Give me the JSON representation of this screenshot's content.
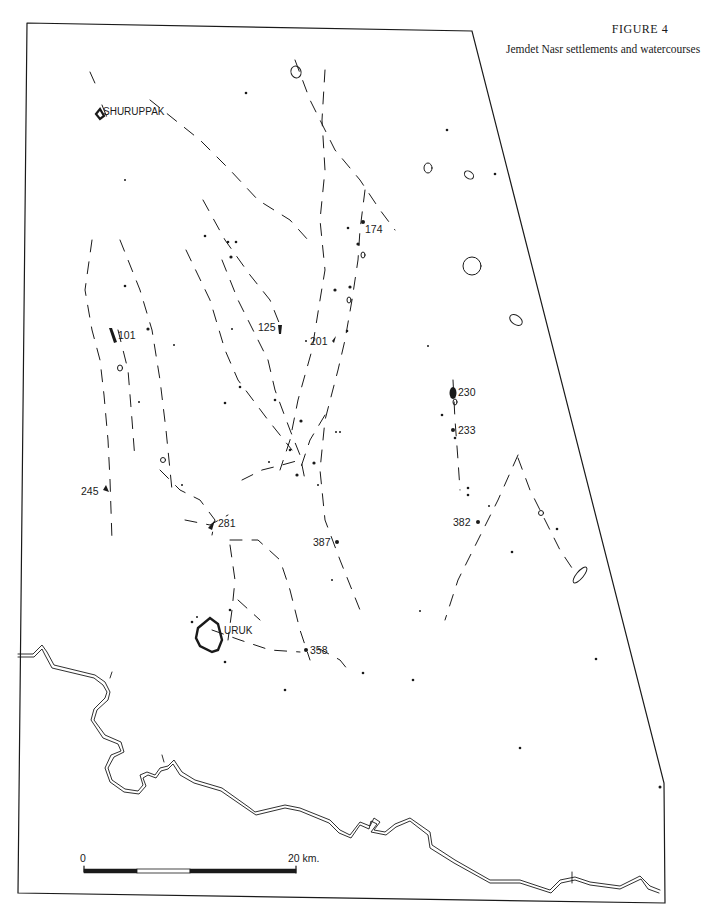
{
  "figure": {
    "number": "FIGURE 4",
    "title": "Jemdet Nasr settlements and watercourses"
  },
  "map": {
    "ink_color": "#1a1a1a",
    "background": "#ffffff",
    "named_sites": [
      {
        "id": "shuruppak",
        "label": "SHURUPPAK"
      },
      {
        "id": "uruk",
        "label": "URUK"
      }
    ],
    "numbered_sites": [
      {
        "id": "s174",
        "label": "174"
      },
      {
        "id": "s101",
        "label": "101"
      },
      {
        "id": "s125",
        "label": "125"
      },
      {
        "id": "s201",
        "label": "201"
      },
      {
        "id": "s230",
        "label": "230"
      },
      {
        "id": "s233",
        "label": "233"
      },
      {
        "id": "s245",
        "label": "245"
      },
      {
        "id": "s281",
        "label": "281"
      },
      {
        "id": "s387",
        "label": "387"
      },
      {
        "id": "s382",
        "label": "382"
      },
      {
        "id": "s358",
        "label": "358"
      }
    ],
    "scale_bar": {
      "start_label": "0",
      "end_label": "20 km.",
      "segments": [
        "black",
        "white",
        "black"
      ]
    }
  }
}
